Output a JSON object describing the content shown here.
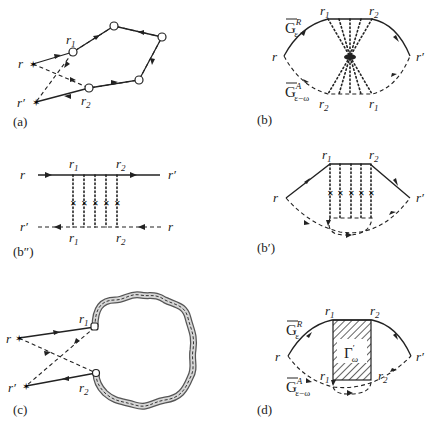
{
  "figure": {
    "panels": [
      {
        "id": "a",
        "caption": "(a)",
        "labels": {
          "r": "r",
          "r_prime": "r′",
          "r1_main": "r",
          "r1_sub": "1",
          "r2_main": "r",
          "r2_sub": "2"
        }
      },
      {
        "id": "b",
        "caption": "(b)",
        "labels": {
          "r": "r",
          "r_prime": "r′",
          "top_r1_main": "r",
          "top_r1_sub": "1",
          "top_r2_main": "r",
          "top_r2_sub": "2",
          "bot_r2_main": "r",
          "bot_r2_sub": "2",
          "bot_r1_main": "r",
          "bot_r1_sub": "1",
          "GR_main": "G",
          "GR_sup": "R",
          "GR_sub": "ε",
          "GA_main": "G",
          "GA_sup": "A",
          "GA_sub": "ε−ω"
        }
      },
      {
        "id": "b2",
        "caption": "(b″)",
        "labels": {
          "left_top": "r",
          "right_top": "r′",
          "left_bot": "r′",
          "right_bot": "r",
          "top_r1_main": "r",
          "top_r1_sub": "1",
          "top_r2_main": "r",
          "top_r2_sub": "2",
          "bot_r1_main": "r",
          "bot_r1_sub": "1",
          "bot_r2_main": "r",
          "bot_r2_sub": "2"
        }
      },
      {
        "id": "b1",
        "caption": "(b′)",
        "labels": {
          "r": "r",
          "r_prime": "r′",
          "top_r1_main": "r",
          "top_r1_sub": "1",
          "top_r2_main": "r",
          "top_r2_sub": "2"
        }
      },
      {
        "id": "c",
        "caption": "(c)",
        "labels": {
          "r": "r",
          "r_prime": "r′",
          "r1_main": "r",
          "r1_sub": "1",
          "r2_main": "r",
          "r2_sub": "2"
        }
      },
      {
        "id": "d",
        "caption": "(d)",
        "labels": {
          "r": "r",
          "r_prime": "r′",
          "top_r1_main": "r",
          "top_r1_sub": "1",
          "top_r2_main": "r",
          "top_r2_sub": "2",
          "bot_r1_main": "r",
          "bot_r1_sub": "1",
          "bot_r2_main": "r",
          "bot_r2_sub": "2",
          "GR_main": "G",
          "GR_sup": "R",
          "GR_sub": "ε",
          "GA_main": "G",
          "GA_sup": "A",
          "GA_sub": "ε−ω",
          "gamma_main": "Γ",
          "gamma_sup": "′",
          "gamma_sub": "ω"
        }
      }
    ]
  }
}
